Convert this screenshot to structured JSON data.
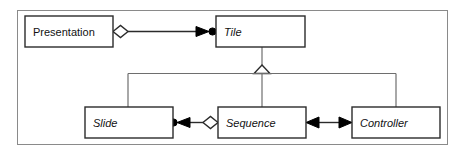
{
  "diagram": {
    "kind": "uml-class-diagram",
    "frame": {
      "label": "diagram-border"
    },
    "colors": {
      "background": "#ffffff",
      "frame_stroke": "#8a8a8a",
      "box_stroke": "#2b2b2b",
      "connector_stroke": "#2b2b2b",
      "bus_stroke": "#6e6e6e",
      "text": "#111111",
      "solid_fill": "#000000",
      "hollow_fill": "#ffffff"
    },
    "classes": [
      {
        "id": "presentation",
        "name": "Presentation",
        "abstract": false,
        "style": "upright",
        "x": 25,
        "y": 16,
        "w": 88,
        "h": 31
      },
      {
        "id": "tile",
        "name": "Tile",
        "abstract": true,
        "style": "italic",
        "x": 216,
        "y": 16,
        "w": 89,
        "h": 31
      },
      {
        "id": "slide",
        "name": "Slide",
        "abstract": true,
        "style": "italic",
        "x": 85,
        "y": 107,
        "w": 88,
        "h": 31
      },
      {
        "id": "sequence",
        "name": "Sequence",
        "abstract": true,
        "style": "italic",
        "x": 218,
        "y": 107,
        "w": 88,
        "h": 31
      },
      {
        "id": "controller",
        "name": "Controller",
        "abstract": true,
        "style": "italic",
        "x": 352,
        "y": 107,
        "w": 88,
        "h": 31
      }
    ],
    "relationships": [
      {
        "id": "presentation-tile",
        "type": "aggregation-directed",
        "source": "presentation",
        "target": "tile",
        "source_decoration": "hollow-diamond",
        "target_decoration": "filled-arrowhead-with-dot"
      },
      {
        "id": "tile-generalization",
        "type": "generalization",
        "parent": "tile",
        "children": [
          "slide",
          "sequence",
          "controller"
        ],
        "parent_decoration": "hollow-triangle"
      },
      {
        "id": "slide-sequence",
        "type": "aggregation-directed",
        "source": "sequence",
        "target": "slide",
        "source_decoration": "hollow-diamond",
        "target_decoration": "filled-arrowhead-with-dot"
      },
      {
        "id": "sequence-controller",
        "type": "association-bidirectional",
        "source": "sequence",
        "target": "controller",
        "source_decoration": "filled-arrowhead",
        "target_decoration": "filled-arrowhead"
      }
    ]
  }
}
